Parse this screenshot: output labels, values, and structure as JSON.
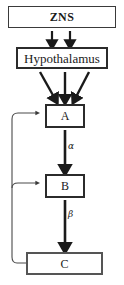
{
  "diagram": {
    "type": "flowchart",
    "title": "",
    "nodes": [
      {
        "id": "zns",
        "label": "ZNS",
        "shape": "rectangle",
        "border": "thin"
      },
      {
        "id": "hypothalamus",
        "label": "Hypothalamus",
        "shape": "rectangle",
        "border": "thick"
      },
      {
        "id": "a",
        "label": "A",
        "shape": "rectangle",
        "border": "thick"
      },
      {
        "id": "b",
        "label": "B",
        "shape": "rectangle",
        "border": "thick"
      },
      {
        "id": "c",
        "label": "C",
        "shape": "rectangle",
        "border": "thick"
      }
    ],
    "edges": [
      {
        "from": "zns",
        "to": "hypothalamus",
        "label": "",
        "style": "thick-arrow",
        "count": 2
      },
      {
        "from": "hypothalamus",
        "to": "a",
        "label": "",
        "style": "thick-arrow",
        "count": 3
      },
      {
        "from": "a",
        "to": "b",
        "label": "α",
        "style": "thick-arrow"
      },
      {
        "from": "b",
        "to": "c",
        "label": "β",
        "style": "thick-arrow"
      },
      {
        "from": "c",
        "to": "a",
        "label": "",
        "style": "thin-feedback"
      },
      {
        "from": "c",
        "to": "b",
        "label": "",
        "style": "thin-feedback"
      }
    ],
    "labels": {
      "alpha": "α",
      "beta": "β"
    },
    "colors": {
      "background": "#ffffff",
      "stroke": "#1a1a1a",
      "box_border_thin": "#3a3a3a",
      "box_border_thick": "#2b2b2b",
      "box_border_c": "#555555",
      "feedback_line": "#4a4a4a",
      "text": "#1a1a1a"
    }
  }
}
